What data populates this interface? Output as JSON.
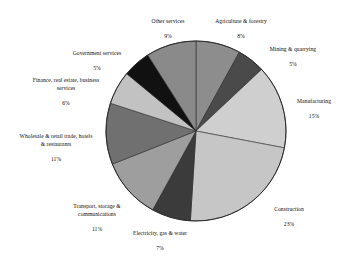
{
  "chart_data": {
    "type": "pie",
    "title": "",
    "labels": [
      "Agriculture & forestry",
      "Mining & quarrying",
      "Manufacturing",
      "Construction",
      "Electricity, gas & water",
      "Transport, storage & communications",
      "Wholesale & retail trade, hotels & restaurants",
      "Finance, real estate, business services",
      "Government services",
      "Other services"
    ],
    "values": [
      8,
      5,
      15,
      23,
      7,
      11,
      11,
      6,
      5,
      9
    ],
    "value_labels": [
      "8%",
      "5%",
      "15%",
      "23%",
      "7%",
      "11%",
      "11%",
      "6%",
      "5%",
      "9%"
    ],
    "unit": "%",
    "start_angle_deg": 0,
    "direction": "clockwise",
    "legend": "none",
    "grid": false,
    "colors": [
      "#8d8d8d",
      "#4a4a4a",
      "#cfcfcf",
      "#c6c6c6",
      "#3b3b3b",
      "#9e9e9e",
      "#707070",
      "#c2c2c2",
      "#111111",
      "#8a8a8a"
    ],
    "outline_color": "#2b2b2b"
  },
  "slices": [
    {
      "key": "agriculture",
      "name": "Agriculture & forestry",
      "pct": "8%",
      "color": "#8d8d8d"
    },
    {
      "key": "mining",
      "name": "Mining & quarrying",
      "pct": "5%",
      "color": "#4a4a4a"
    },
    {
      "key": "manufacturing",
      "name": "Manufacturing",
      "pct": "15%",
      "color": "#cfcfcf"
    },
    {
      "key": "construction",
      "name": "Construction",
      "pct": "23%",
      "color": "#c6c6c6"
    },
    {
      "key": "electricity",
      "name": "Electricity, gas & water",
      "pct": "7%",
      "color": "#3b3b3b"
    },
    {
      "key": "transport",
      "name": "Transport, storage &\ncommunications",
      "pct": "11%",
      "color": "#9e9e9e"
    },
    {
      "key": "wholesale",
      "name": "Wholesale & retail trade, hotels\n& restaurants",
      "pct": "11%",
      "color": "#707070"
    },
    {
      "key": "finance",
      "name": "Finance, real estate, business\nservices",
      "pct": "6%",
      "color": "#c2c2c2"
    },
    {
      "key": "government",
      "name": "Government services",
      "pct": "5%",
      "color": "#111111"
    },
    {
      "key": "other",
      "name": "Other services",
      "pct": "9%",
      "color": "#8a8a8a"
    }
  ]
}
